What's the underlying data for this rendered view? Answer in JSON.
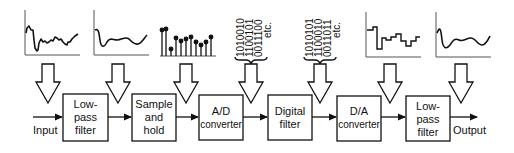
{
  "diagram": {
    "input_label": "Input",
    "output_label": "Output",
    "blocks": [
      {
        "id": "lpf1",
        "lines": [
          "Low-",
          "pass",
          "filter"
        ]
      },
      {
        "id": "sh",
        "lines": [
          "Sample",
          "and",
          "hold"
        ]
      },
      {
        "id": "adc",
        "lines": [
          "A/D",
          "converter"
        ]
      },
      {
        "id": "dsp",
        "lines": [
          "Digital",
          "filter"
        ]
      },
      {
        "id": "dac",
        "lines": [
          "D/A",
          "converter"
        ]
      },
      {
        "id": "lpf2",
        "lines": [
          "Low-",
          "pass",
          "filter"
        ]
      }
    ],
    "bitstreams": [
      {
        "id": "adc-out",
        "lines": [
          "1010010",
          "1100101",
          "0011100",
          "etc."
        ]
      },
      {
        "id": "dsp-out",
        "lines": [
          "1010101",
          "1100010",
          "0011011",
          "etc."
        ]
      }
    ],
    "waveforms": [
      {
        "id": "raw-input",
        "type": "noisy-analog"
      },
      {
        "id": "filtered",
        "type": "smooth-analog"
      },
      {
        "id": "sampled",
        "type": "stem-samples"
      },
      {
        "id": "dac-output",
        "type": "staircase"
      },
      {
        "id": "reconstructed",
        "type": "smooth-analog"
      }
    ],
    "colors": {
      "stroke": "#111111",
      "background": "#ffffff"
    }
  }
}
